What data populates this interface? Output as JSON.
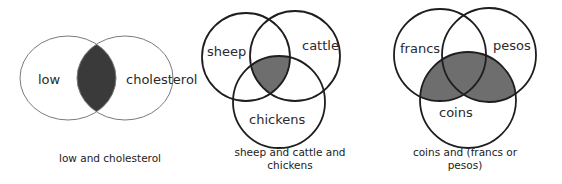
{
  "diagrams": [
    {
      "id": "low-and-cholesterol",
      "sets": [
        "low",
        "cholesterol"
      ],
      "shaded_region": "low ∩ cholesterol",
      "caption": "low and cholesterol",
      "shade_color": "#3a3a3a"
    },
    {
      "id": "sheep-cattle-chickens",
      "sets": [
        "sheep",
        "cattle",
        "chickens"
      ],
      "shaded_region": "sheep ∩ cattle ∩ chickens",
      "caption_line1": "sheep and cattle and",
      "caption_line2": "chickens",
      "shade_color": "#6e6e6e"
    },
    {
      "id": "coins-francs-or-pesos",
      "sets": [
        "francs",
        "pesos",
        "coins"
      ],
      "shaded_region": "coins ∩ (francs ∪ pesos)",
      "caption_line1": "coins and (francs or",
      "caption_line2": "pesos)",
      "shade_color": "#6e6e6e"
    }
  ],
  "colors": {
    "outline_light": "#7a7a7a",
    "outline_dark": "#1e1e1e",
    "text": "#2a2a2a"
  }
}
